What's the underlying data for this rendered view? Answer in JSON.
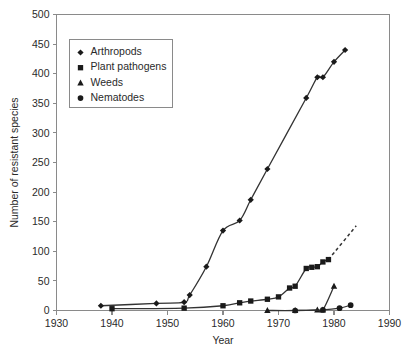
{
  "chart_data": {
    "type": "line",
    "title": "",
    "xlabel": "Year",
    "ylabel": "Number of resistant species",
    "xlim": [
      1930,
      1990
    ],
    "ylim": [
      0,
      500
    ],
    "xticks": [
      1930,
      1940,
      1950,
      1960,
      1970,
      1980,
      1990
    ],
    "yticks": [
      0,
      50,
      100,
      150,
      200,
      250,
      300,
      350,
      400,
      450,
      500
    ],
    "grid": false,
    "legend_position": "upper-left-inset",
    "series": [
      {
        "name": "Arthropods",
        "marker": "diamond",
        "x": [
          1938,
          1948,
          1953,
          1954,
          1957,
          1960,
          1963,
          1965,
          1968,
          1975,
          1977,
          1978,
          1980,
          1982
        ],
        "values": [
          8,
          12,
          14,
          26,
          74,
          135,
          152,
          187,
          239,
          359,
          394,
          394,
          420,
          440
        ]
      },
      {
        "name": "Plant pathogens",
        "marker": "square",
        "x": [
          1940,
          1953,
          1960,
          1963,
          1965,
          1968,
          1970,
          1972,
          1973,
          1975,
          1976,
          1977,
          1978,
          1979
        ],
        "values": [
          3,
          4,
          8,
          13,
          16,
          19,
          23,
          38,
          41,
          71,
          73,
          74,
          82,
          86
        ],
        "dashed_extension": {
          "x": [
            1979,
            1984
          ],
          "values": [
            86,
            143
          ]
        }
      },
      {
        "name": "Weeds",
        "marker": "triangle",
        "x": [
          1968,
          1973,
          1977,
          1978,
          1980
        ],
        "values": [
          0,
          0,
          1,
          1,
          41
        ]
      },
      {
        "name": "Nematodes",
        "marker": "circle",
        "x": [
          1973,
          1978,
          1981,
          1983
        ],
        "values": [
          0,
          1,
          4,
          9
        ]
      }
    ]
  },
  "legend": {
    "items": [
      {
        "label": "Arthropods",
        "marker": "diamond"
      },
      {
        "label": "Plant pathogens",
        "marker": "square"
      },
      {
        "label": "Weeds",
        "marker": "triangle"
      },
      {
        "label": "Nematodes",
        "marker": "circle"
      }
    ]
  },
  "axis": {
    "x_title": "Year",
    "y_title": "Number of resistant species",
    "x_tick_labels": [
      "1930",
      "1940",
      "1950",
      "1960",
      "1970",
      "1980",
      "1990"
    ],
    "y_tick_labels": [
      "0",
      "50",
      "100",
      "150",
      "200",
      "250",
      "300",
      "350",
      "400",
      "450",
      "500"
    ]
  },
  "colors": {
    "line": "#333333",
    "marker": "#1a1a1a",
    "axis": "#8a8a8a",
    "text": "#2a2a2a",
    "background": "#ffffff"
  }
}
